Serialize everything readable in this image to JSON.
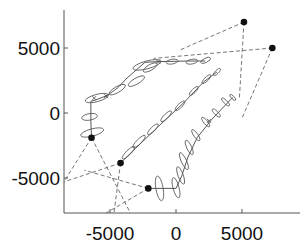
{
  "chart_data": {
    "type": "scatter",
    "title": "",
    "xlabel": "",
    "ylabel": "",
    "xlim": [
      -8500,
      8000
    ],
    "ylim": [
      -7700,
      8000
    ],
    "xticks": [
      -5000,
      0,
      5000
    ],
    "yticks": [
      5000,
      0,
      -5000
    ],
    "xtick_labels": [
      "-5000",
      "0",
      "5000"
    ],
    "ytick_labels": [
      "5000",
      "0",
      "-5000"
    ],
    "grid": false,
    "legend": null,
    "sensors": [
      {
        "x": 5150,
        "y": 7000
      },
      {
        "x": 7300,
        "y": 5000
      },
      {
        "x": -6400,
        "y": -1900
      },
      {
        "x": -4200,
        "y": -3850
      },
      {
        "x": -2100,
        "y": -5800
      }
    ],
    "bearing_lines": [
      {
        "from": [
          5150,
          7000
        ],
        "to": [
          200,
          4800
        ]
      },
      {
        "from": [
          5150,
          7000
        ],
        "to": [
          4800,
          1100
        ]
      },
      {
        "from": [
          7300,
          5000
        ],
        "to": [
          -1700,
          4200
        ]
      },
      {
        "from": [
          7300,
          5000
        ],
        "to": [
          5000,
          -400
        ]
      },
      {
        "from": [
          -6400,
          -1900
        ],
        "to": [
          -8500,
          -5300
        ]
      },
      {
        "from": [
          -6400,
          -1900
        ],
        "to": [
          -3450,
          -7700
        ]
      },
      {
        "from": [
          -4200,
          -3850
        ],
        "to": [
          -8500,
          -5300
        ]
      },
      {
        "from": [
          -4200,
          -3850
        ],
        "to": [
          -4700,
          -7700
        ]
      },
      {
        "from": [
          -2100,
          -5800
        ],
        "to": [
          -6950,
          -4400
        ]
      },
      {
        "from": [
          -2100,
          -5800
        ],
        "to": [
          -5300,
          -7700
        ]
      }
    ],
    "series": [
      {
        "name": "track-1",
        "points": [
          [
            -6400,
            -1900
          ],
          [
            -6450,
            -700
          ],
          [
            -6450,
            900
          ],
          [
            -6100,
            1000
          ],
          [
            -5200,
            1350
          ],
          [
            -4400,
            1950
          ],
          [
            -3700,
            2700
          ],
          [
            -2350,
            3900
          ],
          [
            -1350,
            3950
          ],
          [
            900,
            4000
          ],
          [
            2200,
            4000
          ]
        ],
        "ellipses": [
          {
            "cx": -6350,
            "cy": -1500,
            "rx": 900,
            "ry": 280,
            "angle": -15
          },
          {
            "cx": -6550,
            "cy": -300,
            "rx": 600,
            "ry": 250,
            "angle": -10
          },
          {
            "cx": -6000,
            "cy": 1150,
            "rx": 900,
            "ry": 280,
            "angle": -15
          },
          {
            "cx": -4450,
            "cy": 1800,
            "rx": 700,
            "ry": 230,
            "angle": -30
          },
          {
            "cx": -3000,
            "cy": 2450,
            "rx": 700,
            "ry": 230,
            "angle": -30
          },
          {
            "cx": -1950,
            "cy": 3500,
            "rx": 600,
            "ry": 220,
            "angle": -30
          },
          {
            "cx": -2200,
            "cy": 3700,
            "rx": 1100,
            "ry": 300,
            "angle": -15
          },
          {
            "cx": -300,
            "cy": 3950,
            "rx": 450,
            "ry": 180,
            "angle": -10
          },
          {
            "cx": 1200,
            "cy": 3950,
            "rx": 450,
            "ry": 180,
            "angle": -10
          },
          {
            "cx": 2250,
            "cy": 4050,
            "rx": 400,
            "ry": 160,
            "angle": -25
          }
        ],
        "markers": [
          [
            -6200,
            1150
          ],
          [
            -5300,
            1300
          ],
          [
            -1350,
            3950
          ]
        ]
      },
      {
        "name": "track-2",
        "points": [
          [
            -4200,
            -3850
          ],
          [
            -3050,
            -2700
          ],
          [
            -1300,
            -1000
          ],
          [
            600,
            800
          ],
          [
            2100,
            2400
          ],
          [
            3100,
            3150
          ]
        ],
        "ellipses": [
          {
            "cx": -3600,
            "cy": -3050,
            "rx": 650,
            "ry": 180,
            "angle": -45
          },
          {
            "cx": -2800,
            "cy": -2200,
            "rx": 650,
            "ry": 180,
            "angle": -45
          },
          {
            "cx": -1750,
            "cy": -1250,
            "rx": 550,
            "ry": 170,
            "angle": -45
          },
          {
            "cx": -750,
            "cy": -250,
            "rx": 550,
            "ry": 170,
            "angle": -45
          },
          {
            "cx": 300,
            "cy": 550,
            "rx": 500,
            "ry": 160,
            "angle": -45
          },
          {
            "cx": 1350,
            "cy": 1700,
            "rx": 450,
            "ry": 150,
            "angle": -45
          },
          {
            "cx": 2300,
            "cy": 2600,
            "rx": 450,
            "ry": 150,
            "angle": -45
          },
          {
            "cx": 3100,
            "cy": 3150,
            "rx": 350,
            "ry": 130,
            "angle": -45
          }
        ],
        "markers": [
          [
            -4200,
            -3850
          ]
        ]
      },
      {
        "name": "track-3",
        "points": [
          [
            -2100,
            -5800
          ],
          [
            0,
            -5800
          ],
          [
            450,
            -4800
          ],
          [
            900,
            -3400
          ],
          [
            1600,
            -1900
          ],
          [
            2700,
            -500
          ],
          [
            4300,
            1200
          ]
        ],
        "ellipses": [
          {
            "cx": -1250,
            "cy": -5800,
            "rx": 950,
            "ry": 280,
            "angle": 80
          },
          {
            "cx": 0,
            "cy": -5750,
            "rx": 800,
            "ry": 230,
            "angle": 75
          },
          {
            "cx": 350,
            "cy": -4800,
            "rx": 700,
            "ry": 200,
            "angle": 70
          },
          {
            "cx": 600,
            "cy": -3700,
            "rx": 700,
            "ry": 200,
            "angle": 65
          },
          {
            "cx": 1000,
            "cy": -2650,
            "rx": 600,
            "ry": 190,
            "angle": 65
          },
          {
            "cx": 1500,
            "cy": -1700,
            "rx": 500,
            "ry": 160,
            "angle": 55
          },
          {
            "cx": 2250,
            "cy": -700,
            "rx": 450,
            "ry": 150,
            "angle": 50
          },
          {
            "cx": 3050,
            "cy": 0,
            "rx": 400,
            "ry": 140,
            "angle": 45
          },
          {
            "cx": 3750,
            "cy": 850,
            "rx": 400,
            "ry": 130,
            "angle": 45
          },
          {
            "cx": 4300,
            "cy": 1200,
            "rx": 300,
            "ry": 110,
            "angle": 45
          }
        ],
        "markers": [
          [
            2500,
            -600
          ]
        ]
      }
    ]
  }
}
